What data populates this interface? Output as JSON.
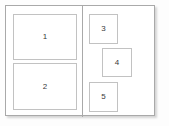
{
  "diagram": {
    "type": "layout-wireframe",
    "canvas": {
      "width": 169,
      "height": 126,
      "background_color": "#fdfdfd"
    },
    "frame": {
      "border_color": "#a9a9a9",
      "fill_color": "#ffffff",
      "shadow": true
    },
    "divider": {
      "orientation": "vertical",
      "color": "#a9a9a9"
    },
    "box_style": {
      "border_color": "#c2c2c2",
      "fill_color": "#ffffff",
      "label_color": "#3a3a3a"
    },
    "columns": [
      {
        "name": "left-column",
        "boxes": [
          {
            "label": "1",
            "x": 7,
            "y": 8,
            "width": 64,
            "height": 46
          },
          {
            "label": "2",
            "x": 7,
            "y": 57,
            "width": 64,
            "height": 47
          }
        ]
      },
      {
        "name": "right-column",
        "boxes": [
          {
            "label": "3",
            "x": 83,
            "y": 8,
            "width": 29,
            "height": 30
          },
          {
            "label": "4",
            "x": 96,
            "y": 42,
            "width": 30,
            "height": 29
          },
          {
            "label": "5",
            "x": 83,
            "y": 76,
            "width": 29,
            "height": 30
          }
        ]
      }
    ]
  }
}
